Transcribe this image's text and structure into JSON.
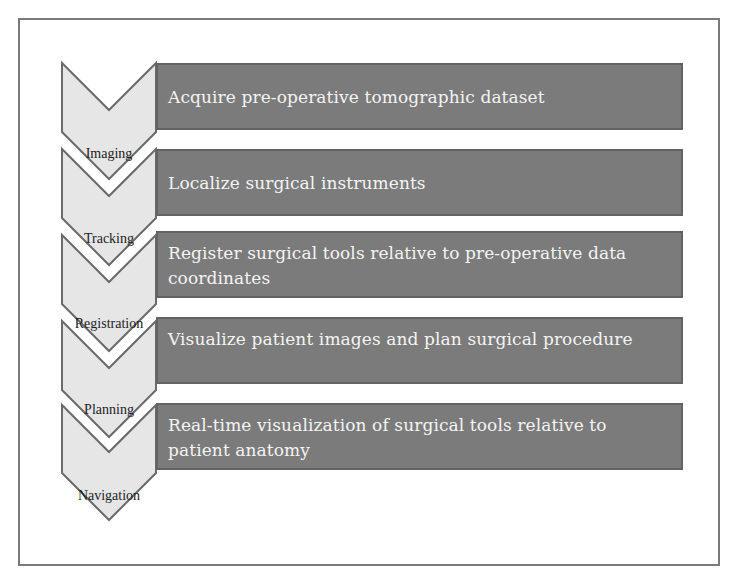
{
  "diagram": {
    "type": "process-flow",
    "colors": {
      "bar_fill": "#7b7b7b",
      "bar_border": "#636363",
      "bar_text": "#f4f4f4",
      "chevron_fill": "#e6e6e6",
      "chevron_border": "#6a6a6a",
      "frame_border": "#7a7a7a"
    },
    "steps": [
      {
        "label": "Imaging",
        "description": "Acquire pre-operative tomographic dataset"
      },
      {
        "label": "Tracking",
        "description": "Localize surgical instruments"
      },
      {
        "label": "Registration",
        "description": "Register surgical tools relative to pre-operative data coordinates"
      },
      {
        "label": "Planning",
        "description": "Visualize patient images and plan surgical procedure"
      },
      {
        "label": "Navigation",
        "description": "Real-time visualization of surgical tools relative to patient anatomy"
      }
    ]
  }
}
